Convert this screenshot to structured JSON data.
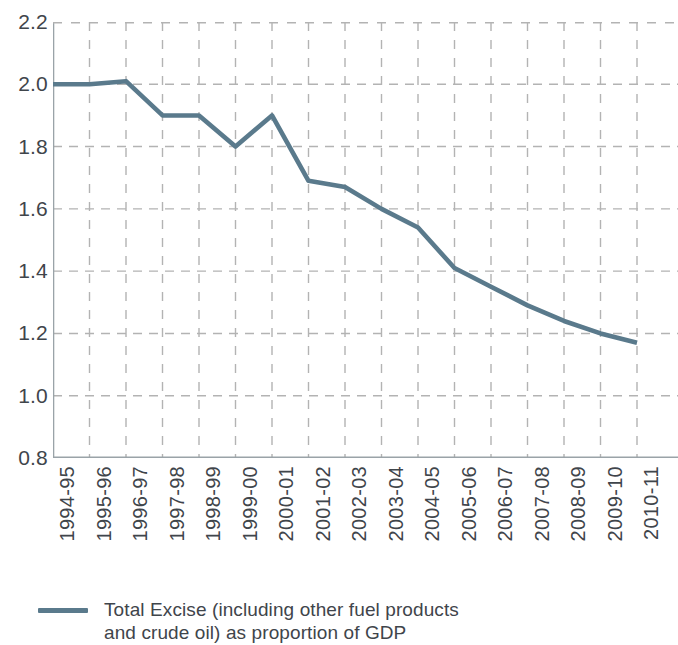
{
  "chart_data": {
    "type": "line",
    "title": "",
    "xlabel": "",
    "ylabel": "",
    "ylim": [
      0.8,
      2.2
    ],
    "y_ticks": [
      "2.2",
      "2.0",
      "1.8",
      "1.6",
      "1.4",
      "1.2",
      "1.0",
      "0.8"
    ],
    "y_tick_values": [
      2.2,
      2.0,
      1.8,
      1.6,
      1.4,
      1.2,
      1.0,
      0.8
    ],
    "grid": true,
    "grid_style": "dashed",
    "legend_position": "bottom-left",
    "categories": [
      "1994-95",
      "1995-96",
      "1996-97",
      "1997-98",
      "1998-99",
      "1999-00",
      "2000-01",
      "2001-02",
      "2002-03",
      "2003-04",
      "2004-05",
      "2005-06",
      "2006-07",
      "2007-08",
      "2008-09",
      "2009-10",
      "2010-11"
    ],
    "series": [
      {
        "name": "Total Excise (including other fuel products and crude oil) as proportion of GDP",
        "color": "#5a7a8c",
        "values": [
          2.0,
          2.0,
          2.01,
          1.9,
          1.9,
          1.8,
          1.9,
          1.69,
          1.67,
          1.6,
          1.54,
          1.41,
          1.35,
          1.29,
          1.24,
          1.2,
          1.17
        ]
      }
    ]
  },
  "legend": {
    "label": "Total Excise (including other fuel products\nand crude oil) as proportion of GDP",
    "swatch_color": "#5a7a8c"
  },
  "style": {
    "line_color": "#5a7a8c",
    "grid_color": "#b3b3b3",
    "axis_color": "#9aa3a8",
    "text_color": "#3f454b",
    "background": "#ffffff"
  }
}
